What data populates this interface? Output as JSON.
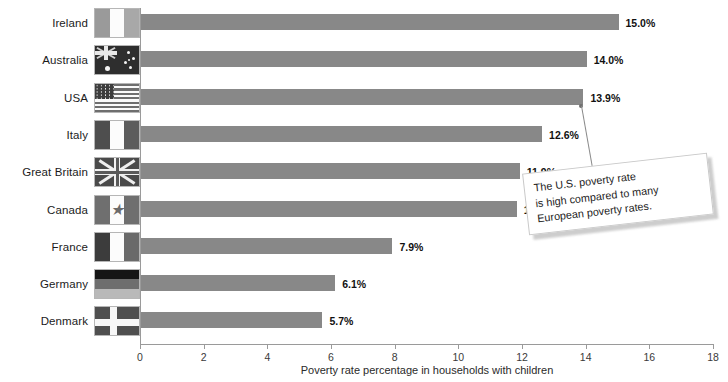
{
  "chart_data": {
    "type": "bar",
    "orientation": "horizontal",
    "title": "",
    "xlabel": "Poverty rate percentage in households with children",
    "ylabel": "",
    "xlim": [
      0,
      18
    ],
    "xticks": [
      0,
      2,
      4,
      6,
      8,
      10,
      12,
      14,
      16,
      18
    ],
    "grid": false,
    "legend": false,
    "bar_color": "#888888",
    "categories": [
      "Ireland",
      "Australia",
      "USA",
      "Italy",
      "Great Britain",
      "Canada",
      "France",
      "Germany",
      "Denmark"
    ],
    "values": [
      15.0,
      14.0,
      13.9,
      12.6,
      11.9,
      11.8,
      7.9,
      6.1,
      5.7
    ],
    "value_labels": [
      "15.0%",
      "14.0%",
      "13.9%",
      "12.6%",
      "11.9%",
      "11.8%",
      "7.9%",
      "6.1%",
      "5.7%"
    ],
    "annotations": [
      {
        "text": "The U.S. poverty rate is high compared to many European poverty rates.",
        "points_to": "USA"
      }
    ]
  },
  "axis": {
    "x_title": "Poverty rate percentage in households with children",
    "tick_labels": [
      "0",
      "2",
      "4",
      "6",
      "8",
      "10",
      "12",
      "14",
      "16",
      "18"
    ]
  },
  "rows": [
    {
      "country": "Ireland",
      "flag": "flag-ireland",
      "value_label": "15.0%",
      "value": 15.0
    },
    {
      "country": "Australia",
      "flag": "flag-australia",
      "value_label": "14.0%",
      "value": 14.0
    },
    {
      "country": "USA",
      "flag": "flag-usa",
      "value_label": "13.9%",
      "value": 13.9
    },
    {
      "country": "Italy",
      "flag": "flag-italy",
      "value_label": "12.6%",
      "value": 12.6
    },
    {
      "country": "Great Britain",
      "flag": "flag-great-britain",
      "value_label": "11.9%",
      "value": 11.9
    },
    {
      "country": "Canada",
      "flag": "flag-canada",
      "value_label": "11.8%",
      "value": 11.8
    },
    {
      "country": "France",
      "flag": "flag-france",
      "value_label": "7.9%",
      "value": 7.9
    },
    {
      "country": "Germany",
      "flag": "flag-germany",
      "value_label": "6.1%",
      "value": 6.1
    },
    {
      "country": "Denmark",
      "flag": "flag-denmark",
      "value_label": "5.7%",
      "value": 5.7
    }
  ],
  "callout": {
    "line1": "The U.S. poverty rate",
    "line2": "is high compared to many",
    "line3": "European poverty rates."
  },
  "colors": {
    "bar": "#888888",
    "axis": "#9a9a9a",
    "text": "#1b1b1b",
    "callout_border": "#c9c9c9"
  }
}
